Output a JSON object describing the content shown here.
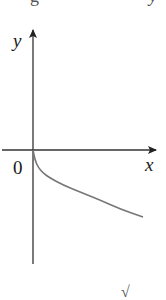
{
  "figure": {
    "axis_labels": {
      "x": "x",
      "y": "y",
      "origin": "0"
    },
    "cropped_text": {
      "top_left": "g",
      "top_right": "y",
      "bottom": "√"
    },
    "colors": {
      "axis": "#222222",
      "curve": "#777777",
      "background": "#ffffff"
    }
  },
  "chart_data": {
    "type": "line",
    "title": "",
    "xlabel": "x",
    "ylabel": "y",
    "function": "y = -sqrt(x)",
    "origin_label": "0",
    "grid": false,
    "legend": null,
    "axis_ticks": [],
    "series": [
      {
        "name": "curve",
        "description": "Curve starting at the origin and decreasing, concave up (shape of y = -√x)",
        "x": [
          0,
          0.25,
          1,
          2,
          3,
          4
        ],
        "y": [
          0,
          -0.5,
          -1,
          -1.41,
          -1.73,
          -2
        ]
      }
    ],
    "pixel_geometry": {
      "origin": [
        33,
        150
      ],
      "x_axis": {
        "from": [
          2,
          150
        ],
        "to": [
          157,
          150
        ]
      },
      "y_axis": {
        "from": [
          33,
          264
        ],
        "to": [
          33,
          29
        ]
      },
      "curve_points": [
        [
          33,
          150
        ],
        [
          35,
          160
        ],
        [
          38,
          167
        ],
        [
          43,
          173
        ],
        [
          50,
          178
        ],
        [
          63,
          185
        ],
        [
          80,
          192
        ],
        [
          100,
          200
        ],
        [
          120,
          209
        ],
        [
          143,
          217
        ]
      ]
    }
  }
}
